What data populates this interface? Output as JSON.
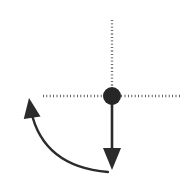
{
  "figure": {
    "background_color": "#ffffff",
    "width": 186,
    "height": 186,
    "stroke_color": "#2b2b2b",
    "dotted_color": "#3a3a3a"
  },
  "elements": {
    "pivot": {
      "name": "pivot-node",
      "shape": "filled-circle",
      "cx": 112,
      "cy": 96,
      "r": 9,
      "fill": "#262626"
    },
    "horizontal_axis": {
      "name": "horizontal-dotted-axis",
      "style": "dotted",
      "x1": 43,
      "y1": 96,
      "x2": 181,
      "y2": 96,
      "stroke_width": 2.4,
      "dash": "0.8 2.6"
    },
    "vertical_axis": {
      "name": "vertical-dotted-axis",
      "style": "dotted",
      "x1": 112,
      "y1": 20,
      "x2": 112,
      "y2": 96,
      "stroke_width": 2.4,
      "dash": "0.8 2.6"
    },
    "force_arrow": {
      "name": "downward-force-arrow",
      "direction": "down",
      "x": 112,
      "y_start": 96,
      "y_end": 170,
      "stroke_width": 2.6,
      "head_width": 18,
      "head_length": 22
    },
    "rotation_arrow": {
      "name": "counter-clockwise-rotation-arrow",
      "direction": "counter-clockwise",
      "tail_x": 108,
      "tail_y": 172,
      "tip_x": 29,
      "tip_y": 98,
      "control_x": 36,
      "control_y": 166,
      "stroke_width": 2.4,
      "head_width": 17,
      "head_length": 20
    }
  },
  "chart_data": {
    "type": "diagram",
    "annotations": [],
    "axis_lines": [
      {
        "orientation": "horizontal",
        "style": "dotted",
        "from": [
          43,
          96
        ],
        "to": [
          181,
          96
        ]
      },
      {
        "orientation": "vertical",
        "style": "dotted",
        "from": [
          112,
          20
        ],
        "to": [
          112,
          96
        ]
      }
    ],
    "vectors": [
      {
        "label": "force",
        "from": [
          112,
          96
        ],
        "to": [
          112,
          170
        ],
        "style": "solid-arrow"
      },
      {
        "label": "rotation",
        "from": [
          108,
          172
        ],
        "to": [
          29,
          98
        ],
        "style": "curved-arrow"
      }
    ],
    "points": [
      {
        "label": "pivot",
        "x": 112,
        "y": 96
      }
    ]
  }
}
